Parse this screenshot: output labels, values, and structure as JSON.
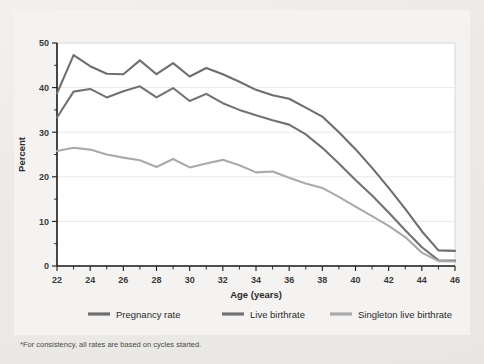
{
  "figure": {
    "background_color": "#eceae7",
    "panel_color": "#ffffff",
    "footnote": "*For consistency, all rates are based on cycles started."
  },
  "chart_data": {
    "type": "line",
    "title": "",
    "subtitle": "",
    "xlabel": "Age (years)",
    "ylabel": "Percent",
    "xlim": [
      22,
      46
    ],
    "ylim": [
      0,
      50
    ],
    "grid": true,
    "legend_position": "bottom",
    "x_tick_labels": [
      "22",
      "24",
      "26",
      "28",
      "30",
      "32",
      "34",
      "36",
      "38",
      "40",
      "42",
      "44",
      "46"
    ],
    "x_tick_values": [
      22,
      24,
      26,
      28,
      30,
      32,
      34,
      36,
      38,
      40,
      42,
      44,
      46
    ],
    "x_minor_tick_values": [
      23,
      25,
      27,
      29,
      31,
      33,
      35,
      37,
      39,
      41,
      43,
      45
    ],
    "y_tick_labels": [
      "0",
      "10",
      "20",
      "30",
      "40",
      "50"
    ],
    "y_tick_values": [
      0,
      10,
      20,
      30,
      40,
      50
    ],
    "y_minor_tick_values": [
      5,
      15,
      25,
      35,
      45
    ],
    "x": [
      22,
      23,
      24,
      25,
      26,
      27,
      28,
      29,
      30,
      31,
      32,
      33,
      34,
      35,
      36,
      37,
      38,
      39,
      40,
      41,
      42,
      43,
      44,
      45,
      46
    ],
    "series": [
      {
        "name": "Pregnancy rate",
        "color": "#6e6e6e",
        "values": [
          38.7,
          47.3,
          44.8,
          43.1,
          43.0,
          46.1,
          43.0,
          45.5,
          42.5,
          44.4,
          43.0,
          41.3,
          39.5,
          38.3,
          37.5,
          35.5,
          33.5,
          30.0,
          26.2,
          22.0,
          17.5,
          12.8,
          7.8,
          3.5,
          3.4
        ]
      },
      {
        "name": "Live birthrate",
        "color": "#727272",
        "values": [
          33.3,
          39.1,
          39.7,
          37.8,
          39.2,
          40.3,
          37.8,
          39.9,
          37.0,
          38.6,
          36.5,
          35.0,
          33.8,
          32.7,
          31.7,
          29.5,
          26.5,
          23.0,
          19.3,
          15.8,
          12.0,
          8.0,
          4.2,
          1.3,
          1.2
        ]
      },
      {
        "name": "Singleton live birthrate",
        "color": "#aaaaaa",
        "values": [
          25.8,
          26.5,
          26.1,
          25.0,
          24.3,
          23.7,
          22.2,
          24.0,
          22.1,
          23.0,
          23.8,
          22.6,
          21.0,
          21.2,
          19.8,
          18.5,
          17.5,
          15.5,
          13.3,
          11.2,
          9.0,
          6.5,
          3.0,
          1.1,
          1.0
        ]
      }
    ],
    "legend_entries": [
      {
        "label": "Pregnancy rate",
        "color": "#6e6e6e"
      },
      {
        "label": "Live birthrate",
        "color": "#727272"
      },
      {
        "label": "Singleton live birthrate",
        "color": "#aaaaaa"
      }
    ]
  }
}
